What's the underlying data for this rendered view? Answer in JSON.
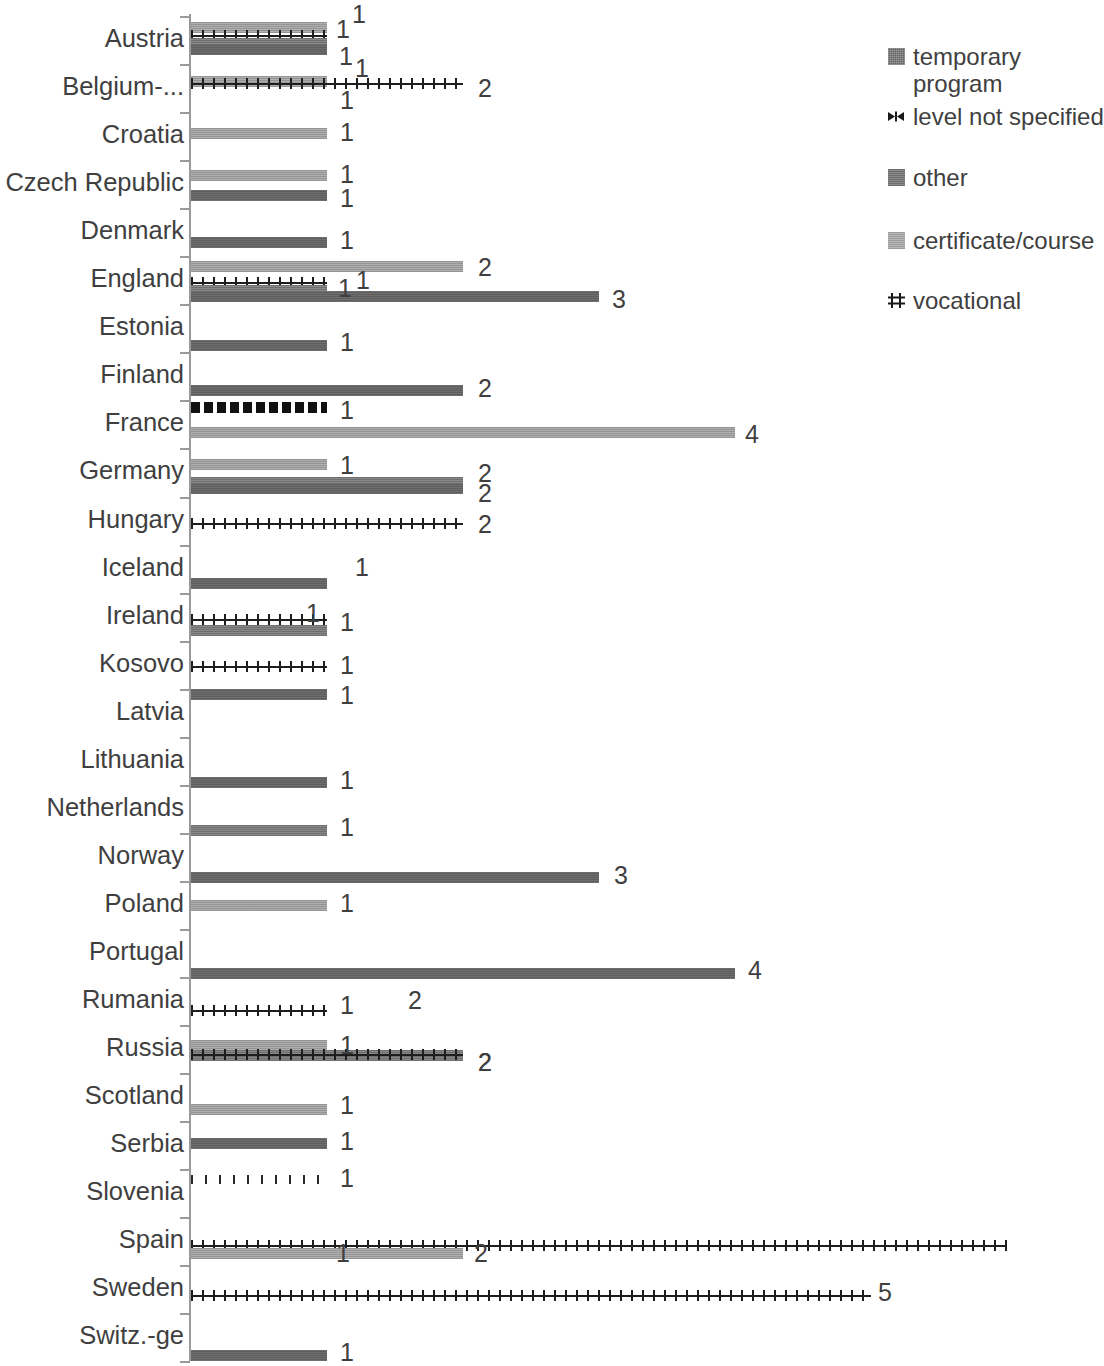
{
  "chart_data": {
    "type": "bar",
    "orientation": "horizontal",
    "title": "",
    "xlabel": "",
    "ylabel": "",
    "xlim": [
      0,
      6
    ],
    "grid": false,
    "legend_position": "right",
    "series_order": [
      "temporary program",
      "level not specified",
      "other",
      "certificate/course",
      "vocational"
    ],
    "categories": [
      "Austria",
      "Belgium-...",
      "Croatia",
      "Czech Republic",
      "Denmark",
      "England",
      "Estonia",
      "Finland",
      "France",
      "Germany",
      "Hungary",
      "Iceland",
      "Ireland",
      "Kosovo",
      "Latvia",
      "Lithuania",
      "Netherlands",
      "Norway",
      "Poland",
      "Portugal",
      "Rumania",
      "Russia",
      "Scotland",
      "Serbia",
      "Slovenia",
      "Spain",
      "Sweden",
      "Switz.-ge"
    ],
    "series": [
      {
        "name": "temporary program",
        "values": [
          1,
          0,
          0,
          1,
          1,
          3,
          1,
          2,
          0,
          2,
          0,
          1,
          0,
          0,
          1,
          1,
          0,
          3,
          0,
          4,
          0,
          0,
          0,
          1,
          0,
          1,
          0,
          1
        ]
      },
      {
        "name": "level not specified",
        "values": [
          0,
          0,
          0,
          0,
          0,
          0,
          0,
          0,
          1,
          0,
          0,
          0,
          0,
          0,
          0,
          0,
          0,
          0,
          0,
          0,
          0,
          0,
          0,
          0,
          0,
          0,
          0,
          0
        ]
      },
      {
        "name": "other",
        "values": [
          1,
          0,
          0,
          0,
          0,
          1,
          0,
          0,
          0,
          2,
          0,
          0,
          1,
          0,
          0,
          0,
          1,
          0,
          0,
          0,
          0,
          2,
          0,
          0,
          0,
          0,
          0,
          0
        ]
      },
      {
        "name": "certificate/course",
        "values": [
          1,
          1,
          1,
          1,
          0,
          2,
          0,
          0,
          4,
          1,
          0,
          0,
          0,
          0,
          0,
          0,
          0,
          0,
          1,
          0,
          0,
          1,
          1,
          0,
          0,
          2,
          0,
          0
        ]
      },
      {
        "name": "vocational",
        "values": [
          1,
          2,
          0,
          0,
          0,
          1,
          0,
          0,
          0,
          0,
          2,
          0,
          1,
          1,
          0,
          0,
          0,
          0,
          0,
          0,
          1,
          2,
          0,
          0,
          1,
          6,
          5,
          0
        ]
      }
    ]
  },
  "legend": {
    "items": [
      {
        "label": "temporary\nprogram",
        "swatch": "temporary-program-swatch"
      },
      {
        "label": "level not specified",
        "swatch": "level-not-specified-swatch"
      },
      {
        "label": "other",
        "swatch": "other-swatch"
      },
      {
        "label": "certificate/course",
        "swatch": "certificate-course-swatch"
      },
      {
        "label": "vocational",
        "swatch": "vocational-swatch"
      }
    ]
  },
  "axis": {
    "category_labels": [
      "Austria",
      "Belgium-...",
      "Croatia",
      "Czech Republic",
      "Denmark",
      "England",
      "Estonia",
      "Finland",
      "France",
      "Germany",
      "Hungary",
      "Iceland",
      "Ireland",
      "Kosovo",
      "Latvia",
      "Lithuania",
      "Netherlands",
      "Norway",
      "Poland",
      "Portugal",
      "Rumania",
      "Russia",
      "Scotland",
      "Serbia",
      "Slovenia",
      "Spain",
      "Sweden",
      "Switz.-ge"
    ]
  },
  "bars": [
    {
      "cat": "Austria",
      "series": "certificate/course",
      "value": 1,
      "label": "1",
      "y": 22,
      "labelx": 336,
      "labely": 17
    },
    {
      "cat": "Austria",
      "series": "vocational",
      "value": 1,
      "label": "1",
      "y": 30,
      "labelx": 352,
      "labely": 2
    },
    {
      "cat": "Austria",
      "series": "other",
      "value": 1,
      "label": "1",
      "y": 38,
      "labelx": 339,
      "labely": 44
    },
    {
      "cat": "Austria",
      "series": "temporary program",
      "value": 1,
      "label": "1",
      "y": 44,
      "labelx": 355,
      "labely": 56
    },
    {
      "cat": "Belgium-...",
      "series": "certificate/course",
      "value": 1,
      "label": "1",
      "y": 76,
      "labelx": 340,
      "labely": 88
    },
    {
      "cat": "Belgium-...",
      "series": "vocational",
      "value": 2,
      "label": "2",
      "y": 78,
      "labelx": 478,
      "labely": 76
    },
    {
      "cat": "Croatia",
      "series": "certificate/course",
      "value": 1,
      "label": "1",
      "y": 128,
      "labelx": 340,
      "labely": 120
    },
    {
      "cat": "Czech Republic",
      "series": "certificate/course",
      "value": 1,
      "label": "1",
      "y": 170,
      "labelx": 340,
      "labely": 162
    },
    {
      "cat": "Czech Republic",
      "series": "temporary program",
      "value": 1,
      "label": "1",
      "y": 190,
      "labelx": 340,
      "labely": 186
    },
    {
      "cat": "Denmark",
      "series": "temporary program",
      "value": 1,
      "label": "1",
      "y": 237,
      "labelx": 340,
      "labely": 228
    },
    {
      "cat": "England",
      "series": "certificate/course",
      "value": 2,
      "label": "2",
      "y": 261,
      "labelx": 478,
      "labely": 255
    },
    {
      "cat": "England",
      "series": "vocational",
      "value": 1,
      "label": "1",
      "y": 277,
      "labelx": 338,
      "labely": 276
    },
    {
      "cat": "England",
      "series": "other",
      "value": 1,
      "label": "1",
      "y": 285,
      "labelx": 356,
      "labely": 268
    },
    {
      "cat": "England",
      "series": "temporary program",
      "value": 3,
      "label": "3",
      "y": 291,
      "labelx": 612,
      "labely": 287
    },
    {
      "cat": "Estonia",
      "series": "temporary program",
      "value": 1,
      "label": "1",
      "y": 340,
      "labelx": 340,
      "labely": 330
    },
    {
      "cat": "Finland",
      "series": "temporary program",
      "value": 2,
      "label": "2",
      "y": 385,
      "labelx": 478,
      "labely": 376
    },
    {
      "cat": "France",
      "series": "level not specified",
      "value": 1,
      "label": "1",
      "y": 402,
      "labelx": 340,
      "labely": 398
    },
    {
      "cat": "France",
      "series": "certificate/course",
      "value": 4,
      "label": "4",
      "y": 427,
      "labelx": 745,
      "labely": 422
    },
    {
      "cat": "Germany",
      "series": "certificate/course",
      "value": 1,
      "label": "1",
      "y": 459,
      "labelx": 340,
      "labely": 453
    },
    {
      "cat": "Germany",
      "series": "other",
      "value": 2,
      "label": "2",
      "y": 477,
      "labelx": 478,
      "labely": 461
    },
    {
      "cat": "Germany",
      "series": "temporary program",
      "value": 2,
      "label": "2",
      "y": 483,
      "labelx": 478,
      "labely": 481
    },
    {
      "cat": "Hungary",
      "series": "vocational",
      "value": 2,
      "label": "2",
      "y": 518,
      "labelx": 478,
      "labely": 512
    },
    {
      "cat": "Iceland",
      "series": "temporary program",
      "value": 1,
      "label": "1",
      "y": 578,
      "labelx": 355,
      "labely": 555
    },
    {
      "cat": "Ireland",
      "series": "vocational",
      "value": 1,
      "label": "1",
      "y": 614,
      "labelx": 306,
      "labely": 601
    },
    {
      "cat": "Ireland",
      "series": "other",
      "value": 1,
      "label": "1",
      "y": 625,
      "labelx": 340,
      "labely": 610
    },
    {
      "cat": "Kosovo",
      "series": "vocational",
      "value": 1,
      "label": "1",
      "y": 661,
      "labelx": 340,
      "labely": 653
    },
    {
      "cat": "Latvia",
      "series": "temporary program",
      "value": 1,
      "label": "1",
      "y": 689,
      "labelx": 340,
      "labely": 683
    },
    {
      "cat": "Lithuania",
      "series": "temporary program",
      "value": 1,
      "label": "1",
      "y": 777,
      "labelx": 340,
      "labely": 768
    },
    {
      "cat": "Netherlands",
      "series": "other",
      "value": 1,
      "label": "1",
      "y": 825,
      "labelx": 340,
      "labely": 815
    },
    {
      "cat": "Norway",
      "series": "temporary program",
      "value": 3,
      "label": "3",
      "y": 872,
      "labelx": 614,
      "labely": 863
    },
    {
      "cat": "Poland",
      "series": "certificate/course",
      "value": 1,
      "label": "1",
      "y": 900,
      "labelx": 340,
      "labely": 891
    },
    {
      "cat": "Portugal",
      "series": "temporary program",
      "value": 4,
      "label": "4",
      "y": 968,
      "labelx": 748,
      "labely": 958
    },
    {
      "cat": "Rumania",
      "series": "vocational",
      "value": 1,
      "label": "1",
      "y": 1005,
      "labelx": 340,
      "labely": 993
    },
    {
      "cat": "Rumania",
      "series": "",
      "value": 0,
      "label": "2",
      "y": 1005,
      "labelx": 408,
      "labely": 988
    },
    {
      "cat": "Russia",
      "series": "certificate/course",
      "value": 1,
      "label": "1",
      "y": 1040,
      "labelx": 340,
      "labely": 1033
    },
    {
      "cat": "Russia",
      "series": "other",
      "value": 2,
      "label": "2",
      "y": 1050,
      "labelx": 478,
      "labely": 1050
    },
    {
      "cat": "Russia",
      "series": "vocational",
      "value": 2,
      "label": "2",
      "y": 1049,
      "labelx": 478,
      "labely": 1050
    },
    {
      "cat": "Scotland",
      "series": "certificate/course",
      "value": 1,
      "label": "1",
      "y": 1104,
      "labelx": 340,
      "labely": 1093
    },
    {
      "cat": "Serbia",
      "series": "temporary program",
      "value": 1,
      "label": "1",
      "y": 1138,
      "labelx": 340,
      "labely": 1129
    },
    {
      "cat": "Slovenia",
      "series": "dotted",
      "value": 1,
      "label": "1",
      "y": 1175,
      "labelx": 340,
      "labely": 1166
    },
    {
      "cat": "Spain",
      "series": "vocational",
      "value": 6,
      "label": "",
      "y": 1240,
      "labelx": 0,
      "labely": 0
    },
    {
      "cat": "Spain",
      "series": "temporary program",
      "value": 1,
      "label": "1",
      "y": 1248,
      "labelx": 336,
      "labely": 1241
    },
    {
      "cat": "Spain",
      "series": "certificate/course",
      "value": 2,
      "label": "2",
      "y": 1248,
      "labelx": 474,
      "labely": 1241
    },
    {
      "cat": "Sweden",
      "series": "vocational",
      "value": 5,
      "label": "5",
      "y": 1290,
      "labelx": 878,
      "labely": 1280
    },
    {
      "cat": "Switz.-ge",
      "series": "temporary program",
      "value": 1,
      "label": "1",
      "y": 1350,
      "labelx": 340,
      "labely": 1340
    }
  ]
}
